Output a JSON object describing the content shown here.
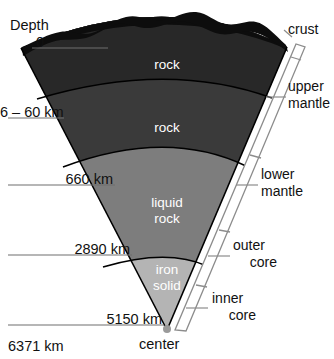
{
  "diagram": {
    "title_depth": "Depth",
    "depth_labels": [
      {
        "id": "surface",
        "text": "0"
      },
      {
        "id": "crust-base",
        "text": "6 – 60 km"
      },
      {
        "id": "upper-mantle-base",
        "text": "660 km"
      },
      {
        "id": "lower-mantle-base",
        "text": "2890 km"
      },
      {
        "id": "outer-core-base",
        "text": "5150 km"
      },
      {
        "id": "center-depth",
        "text": "6371 km"
      }
    ],
    "center_label": "center",
    "layer_labels": [
      {
        "id": "crust-rock",
        "text": "rock"
      },
      {
        "id": "mantle-rock",
        "text": "rock"
      },
      {
        "id": "outer-core-liquid-rock",
        "text": "liquid\nrock"
      },
      {
        "id": "inner-core-iron-solid",
        "text": "iron\nsolid"
      }
    ],
    "layer_label_lines": {
      "crust_rock": "rock",
      "mantle_rock": "rock",
      "liquid_rock_1": "liquid",
      "liquid_rock_2": "rock",
      "iron_solid_1": "iron",
      "iron_solid_2": "solid"
    },
    "bracket_labels": {
      "crust": "crust",
      "upper_mantle_1": "upper",
      "upper_mantle_2": "mantle",
      "lower_mantle_1": "lower",
      "lower_mantle_2": "mantle",
      "outer_core_1": "outer",
      "outer_core_2": "core",
      "inner_core_1": "inner",
      "inner_core_2": "core"
    },
    "colors": {
      "crust": "#1c1c1c",
      "upper_mantle": "#3a3a3a",
      "lower_mantle": "#565656",
      "outer_core": "#7d7d7d",
      "inner_core": "#b4b4b4",
      "outline": "#000000",
      "leader_line": "#6e6e6e",
      "bracket": "#8c8c8c",
      "background": "#ffffff",
      "text": "#111111",
      "wedge_text": "#ffffff"
    }
  }
}
